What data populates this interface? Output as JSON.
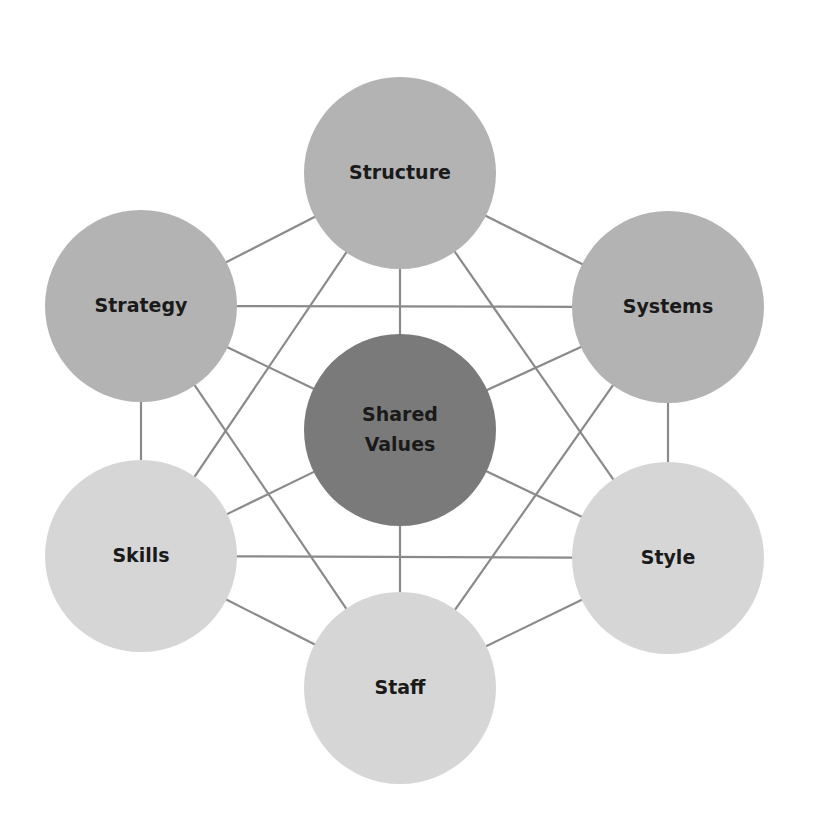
{
  "diagram": {
    "colors": {
      "line": "#8a8a8a",
      "dark": "#7a7a7a",
      "medium": "#b3b3b3",
      "light": "#d6d6d6",
      "text": "#1a1a1a"
    },
    "nodes": [
      {
        "id": "structure",
        "label": "Structure",
        "cx": 400,
        "cy": 173,
        "r": 96,
        "tone": "medium"
      },
      {
        "id": "strategy",
        "label": "Strategy",
        "cx": 141,
        "cy": 306,
        "r": 96,
        "tone": "medium"
      },
      {
        "id": "systems",
        "label": "Systems",
        "cx": 668,
        "cy": 307,
        "r": 96,
        "tone": "medium"
      },
      {
        "id": "shared-values",
        "label": "Shared Values",
        "lines": [
          "Shared",
          "Values"
        ],
        "cx": 400,
        "cy": 430,
        "r": 96,
        "tone": "dark"
      },
      {
        "id": "skills",
        "label": "Skills",
        "cx": 141,
        "cy": 556,
        "r": 96,
        "tone": "light"
      },
      {
        "id": "style",
        "label": "Style",
        "cx": 668,
        "cy": 558,
        "r": 96,
        "tone": "light"
      },
      {
        "id": "staff",
        "label": "Staff",
        "cx": 400,
        "cy": 688,
        "r": 96,
        "tone": "light"
      }
    ],
    "edges": [
      [
        "structure",
        "strategy"
      ],
      [
        "structure",
        "systems"
      ],
      [
        "structure",
        "shared-values"
      ],
      [
        "structure",
        "skills"
      ],
      [
        "structure",
        "style"
      ],
      [
        "strategy",
        "systems"
      ],
      [
        "strategy",
        "shared-values"
      ],
      [
        "strategy",
        "skills"
      ],
      [
        "strategy",
        "staff"
      ],
      [
        "systems",
        "shared-values"
      ],
      [
        "systems",
        "style"
      ],
      [
        "systems",
        "staff"
      ],
      [
        "shared-values",
        "skills"
      ],
      [
        "shared-values",
        "style"
      ],
      [
        "shared-values",
        "staff"
      ],
      [
        "skills",
        "style"
      ],
      [
        "skills",
        "staff"
      ],
      [
        "style",
        "staff"
      ]
    ]
  }
}
